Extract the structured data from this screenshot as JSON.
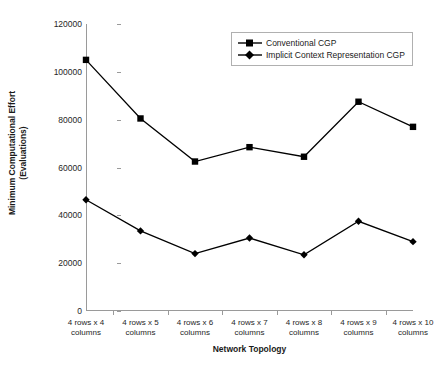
{
  "chart_data": {
    "type": "line",
    "title": "",
    "xlabel": "Network Topology",
    "ylabel": "Minimum Computational Effort (Evaluations)",
    "ylabel_line1": "Minimum Computational Effort",
    "ylabel_line2": "(Evaluations)",
    "categories": [
      "4 rows x 4 columns",
      "4 rows x 5 columns",
      "4 rows x 6 columns",
      "4 rows x 7 columns",
      "4 rows x 8 columns",
      "4 rows x 9 columns",
      "4 rows x 10 columns"
    ],
    "category_lines": [
      [
        "4 rows x 4",
        "columns"
      ],
      [
        "4 rows x 5",
        "columns"
      ],
      [
        "4 rows x 6",
        "columns"
      ],
      [
        "4 rows x 7",
        "columns"
      ],
      [
        "4 rows x 8",
        "columns"
      ],
      [
        "4 rows x 9",
        "columns"
      ],
      [
        "4 rows x 10",
        "columns"
      ]
    ],
    "ylim": [
      0,
      120000
    ],
    "ytick_values": [
      0,
      20000,
      40000,
      60000,
      80000,
      100000,
      120000
    ],
    "ytick_labels": [
      "0",
      "20000",
      "40000",
      "60000",
      "80000",
      "100000",
      "120000"
    ],
    "grid": false,
    "legend_position": "top-right",
    "series": [
      {
        "name": "Conventional CGP",
        "marker": "square",
        "color": "#000000",
        "values": [
          105000,
          80500,
          62500,
          68500,
          64500,
          87500,
          77000
        ]
      },
      {
        "name": "Implicit Context Representation CGP",
        "marker": "diamond",
        "color": "#000000",
        "values": [
          46500,
          33500,
          24000,
          30500,
          23500,
          37500,
          29000
        ]
      }
    ]
  }
}
